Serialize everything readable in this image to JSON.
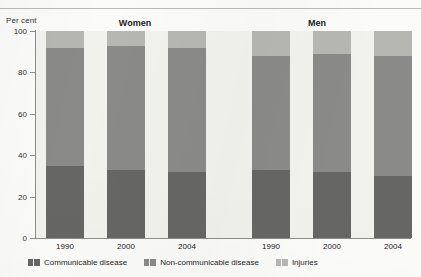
{
  "header": {
    "axis_unit": "Per cent",
    "groups": [
      {
        "name": "women",
        "label": "Women"
      },
      {
        "name": "men",
        "label": "Men"
      }
    ]
  },
  "legend": {
    "items": [
      {
        "key": "communicable",
        "label": "Communicable disease",
        "color": "#666664"
      },
      {
        "key": "noncommunicable",
        "label": "Non-communicable disease",
        "color": "#8a8a88"
      },
      {
        "key": "injuries",
        "label": "Injuries",
        "color": "#b6b6b3"
      }
    ]
  },
  "axis": {
    "y_ticks": [
      "100",
      "80",
      "60",
      "40",
      "20",
      "0"
    ],
    "x_ticks": [
      "1990",
      "2000",
      "2004",
      "1990",
      "2000",
      "2004"
    ]
  },
  "chart_data": {
    "type": "bar",
    "title": "",
    "subtitle": "",
    "xlabel": "",
    "ylabel": "Per cent",
    "ylim": [
      0,
      100
    ],
    "yticks": [
      0,
      20,
      40,
      60,
      80,
      100
    ],
    "grid": false,
    "stacked": true,
    "stack_total": 100,
    "legend_position": "bottom-left",
    "group_labels": [
      "Women",
      "Men"
    ],
    "categories": [
      "1990",
      "2000",
      "2004",
      "1990",
      "2000",
      "2004"
    ],
    "category_groups": [
      "Women",
      "Women",
      "Women",
      "Men",
      "Men",
      "Men"
    ],
    "series": [
      {
        "name": "Communicable disease",
        "color": "#666664",
        "values": [
          35,
          33,
          32,
          33,
          32,
          30
        ]
      },
      {
        "name": "Non-communicable disease",
        "color": "#8a8a88",
        "values": [
          57,
          60,
          60,
          55,
          57,
          58
        ]
      },
      {
        "name": "Injuries",
        "color": "#b6b6b3",
        "values": [
          8,
          7,
          8,
          12,
          11,
          12
        ]
      }
    ]
  }
}
